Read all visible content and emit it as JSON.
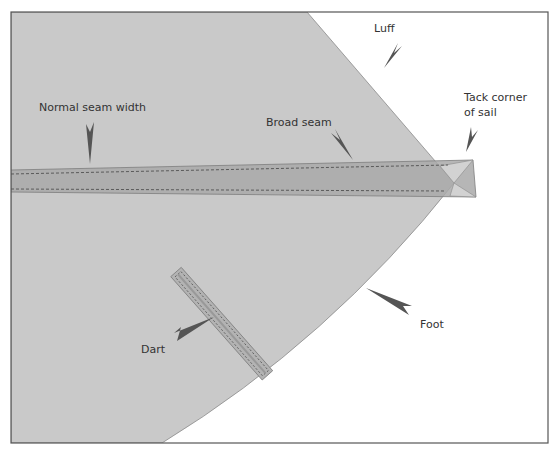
{
  "diagram": {
    "colors": {
      "sail_fill": "#c9c9c9",
      "seam_fill": "#a9a9a9",
      "seam_overlap_fill": "#b8b8b8",
      "arrow_fill": "#555555",
      "frame_stroke": "#555555",
      "stitch_stroke": "#444444",
      "text": "#333333"
    },
    "labels": {
      "luff": "Luff",
      "tack_line1": "Tack corner",
      "tack_line2": "of sail",
      "broad_seam": "Broad seam",
      "normal_seam": "Normal seam width",
      "dart": "Dart",
      "foot": "Foot"
    }
  }
}
